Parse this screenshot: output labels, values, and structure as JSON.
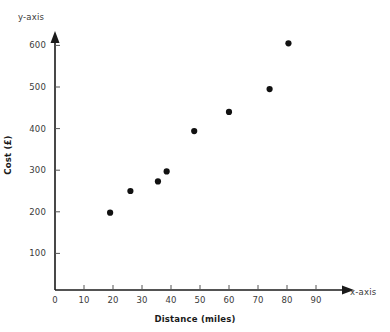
{
  "chart_data": {
    "type": "scatter",
    "title": "",
    "xlabel": "Distance (miles)",
    "ylabel": "Cost (£)",
    "x_axis_corner_label": "x-axis",
    "y_axis_corner_label": "y-axis",
    "xlim": [
      0,
      95
    ],
    "ylim": [
      0,
      640
    ],
    "xticks": [
      0,
      10,
      20,
      30,
      40,
      50,
      60,
      70,
      80,
      90
    ],
    "xtick_labels": [
      "0",
      "10",
      "20",
      "30",
      "40",
      "50",
      "60",
      "70",
      "80",
      "90"
    ],
    "yticks": [
      100,
      200,
      300,
      400,
      500,
      600
    ],
    "ytick_labels": [
      "100",
      "200",
      "300",
      "400",
      "500",
      "600"
    ],
    "grid": false,
    "legend": false,
    "marker": "filled-circle",
    "marker_color": "#111111",
    "axis_color": "#1a1a1a",
    "points": [
      {
        "x": 19,
        "y": 198
      },
      {
        "x": 26,
        "y": 250
      },
      {
        "x": 35.5,
        "y": 273
      },
      {
        "x": 38.5,
        "y": 297
      },
      {
        "x": 48,
        "y": 394
      },
      {
        "x": 60,
        "y": 440
      },
      {
        "x": 74,
        "y": 495
      },
      {
        "x": 80.5,
        "y": 605
      }
    ]
  }
}
